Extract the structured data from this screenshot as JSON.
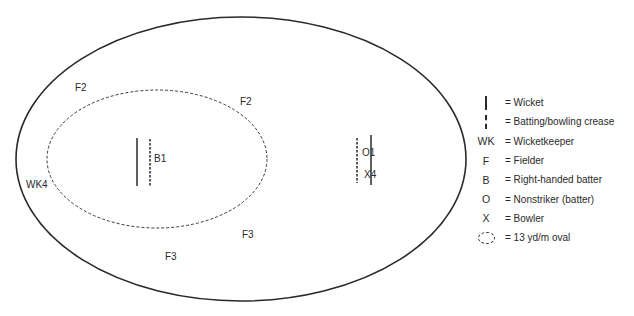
{
  "diagram": {
    "type": "cricket field placement",
    "outer_boundary": {
      "shape": "ellipse",
      "style": "solid"
    },
    "inner_oval": {
      "shape": "ellipse",
      "style": "dashed",
      "meaning": "13 yd/m oval"
    },
    "pitch": {
      "batting_end": {
        "wicket": "solid line",
        "crease": "dashed line"
      },
      "bowling_end": {
        "wicket": "solid line",
        "crease": "dashed line"
      }
    }
  },
  "field_labels": {
    "f2_left": "F2",
    "f2_right": "F2",
    "b1": "B1",
    "wk4": "WK4",
    "o1": "O1",
    "x4": "X4",
    "f3_right": "F3",
    "f3_left": "F3"
  },
  "legend": {
    "items": [
      {
        "symbol": "wicket",
        "symbol_text": "",
        "label": "= Wicket"
      },
      {
        "symbol": "crease",
        "symbol_text": "",
        "label": "= Batting/bowling crease"
      },
      {
        "symbol": "text",
        "symbol_text": "WK",
        "label": "= Wicketkeeper"
      },
      {
        "symbol": "text",
        "symbol_text": "F",
        "label": "= Fielder"
      },
      {
        "symbol": "text",
        "symbol_text": "B",
        "label": "= Right-handed batter"
      },
      {
        "symbol": "text",
        "symbol_text": "O",
        "label": "= Nonstriker (batter)"
      },
      {
        "symbol": "text",
        "symbol_text": "X",
        "label": "= Bowler"
      },
      {
        "symbol": "oval",
        "symbol_text": "",
        "label": "= 13 yd/m oval"
      }
    ]
  },
  "colors": {
    "line": "#2a2a2a",
    "background": "#ffffff"
  }
}
